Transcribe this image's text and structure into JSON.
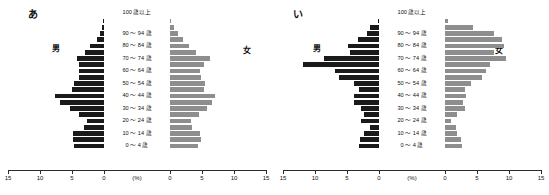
{
  "figure": {
    "units_label": "(%)",
    "male_label": "男",
    "female_label": "女",
    "top_age_label": "100 歳以上",
    "male_color": "#1a1a1a",
    "female_color": "#8e8e8e",
    "axis_ticks_left": [
      "15",
      "10",
      "5",
      "0"
    ],
    "axis_ticks_right": [
      "0",
      "5",
      "10",
      "15"
    ]
  },
  "chart_data": [
    {
      "type": "bar",
      "title": "あ",
      "subtitle": "population pyramid",
      "xlabel": "(%)",
      "ylabel": "",
      "xlim": [
        -15,
        15
      ],
      "grid": false,
      "legend": [
        "男",
        "女"
      ],
      "legend_position": "outside-left-and-right",
      "categories": [
        "100 歳以上",
        "95 ～ 99 歳",
        "90 ～ 94 歳",
        "85 ～ 89 歳",
        "80 ～ 84 歳",
        "75 ～ 79 歳",
        "70 ～ 74 歳",
        "65 ～ 69 歳",
        "60 ～ 64 歳",
        "55 ～ 59 歳",
        "50 ～ 54 歳",
        "45 ～ 49 歳",
        "40 ～ 44 歳",
        "35 ～ 39 歳",
        "30 ～ 34 歳",
        "25 ～ 29 歳",
        "20 ～ 24 歳",
        "15 ～ 19 歳",
        "10 ～ 14 歳",
        "5 ～ 9 歳",
        "0 ～ 4 歳"
      ],
      "visible_category_labels": [
        "100 歳以上",
        "90 ～ 94 歳",
        "80 ～ 84 歳",
        "70 ～ 74 歳",
        "60 ～ 64 歳",
        "50 ～ 54 歳",
        "40 ～ 44 歳",
        "30 ～ 34 歳",
        "20 ～ 24 歳",
        "10 ～ 14 歳",
        "0 ～ 4 歳"
      ],
      "series": [
        {
          "name": "男",
          "values": [
            0.1,
            0.3,
            0.6,
            1.2,
            2.4,
            3.2,
            4.6,
            4.2,
            4.3,
            4.3,
            5.1,
            5.4,
            8.2,
            7.4,
            5.7,
            4.2,
            2.9,
            3.3,
            5.2,
            5.3,
            5.1
          ]
        },
        {
          "name": "女",
          "values": [
            0.2,
            0.7,
            1.3,
            2.2,
            3.2,
            4.3,
            6.7,
            5.7,
            5.1,
            5.2,
            5.9,
            5.8,
            7.6,
            7.0,
            6.2,
            4.9,
            3.5,
            3.7,
            5.1,
            5.2,
            4.8
          ]
        }
      ]
    },
    {
      "type": "bar",
      "title": "い",
      "subtitle": "population pyramid",
      "xlabel": "(%)",
      "ylabel": "",
      "xlim": [
        -15,
        15
      ],
      "grid": false,
      "legend": [
        "男",
        "女"
      ],
      "legend_position": "outside-left-and-right",
      "categories": [
        "100 歳以上",
        "95 ～ 99 歳",
        "90 ～ 94 歳",
        "85 ～ 89 歳",
        "80 ～ 84 歳",
        "75 ～ 79 歳",
        "70 ～ 74 歳",
        "65 ～ 69 歳",
        "60 ～ 64 歳",
        "55 ～ 59 歳",
        "50 ～ 54 歳",
        "45 ～ 49 歳",
        "40 ～ 44 歳",
        "35 ～ 39 歳",
        "30 ～ 34 歳",
        "25 ～ 29 歳",
        "20 ～ 24 歳",
        "15 ～ 19 歳",
        "10 ～ 14 歳",
        "5 ～ 9 歳",
        "0 ～ 4 歳"
      ],
      "visible_category_labels": [
        "100 歳以上",
        "90 ～ 94 歳",
        "80 ～ 84 歳",
        "70 ～ 74 歳",
        "60 ～ 64 歳",
        "50 ～ 54 歳",
        "40 ～ 44 歳",
        "30 ～ 34 歳",
        "20 ～ 24 歳",
        "10 ～ 14 歳",
        "0 ～ 4 歳"
      ],
      "series": [
        {
          "name": "男",
          "values": [
            0.2,
            1.5,
            2.0,
            3.5,
            5.2,
            4.9,
            9.3,
            12.8,
            7.4,
            6.8,
            4.3,
            3.3,
            4.3,
            4.2,
            3.0,
            2.6,
            3.0,
            1.6,
            2.6,
            3.2,
            3.4
          ]
        },
        {
          "name": "女",
          "values": [
            0.5,
            4.7,
            8.2,
            9.6,
            10.0,
            8.3,
            10.3,
            7.5,
            6.9,
            6.2,
            4.4,
            3.3,
            3.6,
            3.1,
            3.3,
            2.0,
            1.0,
            1.9,
            2.1,
            2.7,
            2.8
          ]
        }
      ]
    }
  ]
}
